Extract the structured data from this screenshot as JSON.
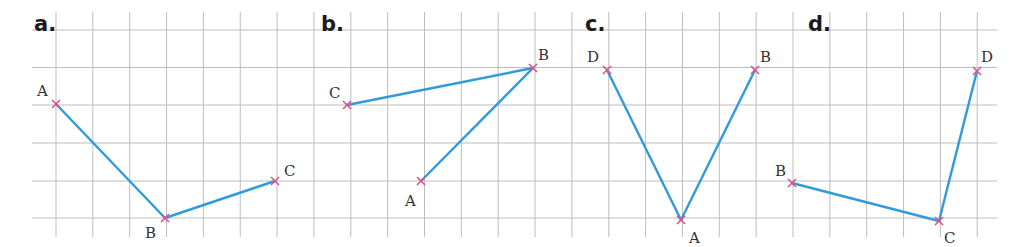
{
  "grid": {
    "x0": 56,
    "spacing_x": 36.85,
    "cols_from": 0,
    "cols_to": 25,
    "h_lines_y": [
      30,
      67.5,
      105,
      143,
      181,
      218
    ],
    "h_left": 32,
    "h_right": 997,
    "v_top": 12,
    "v_bottom": 237,
    "color": "#bdbdbd"
  },
  "colors": {
    "segment": "#2e9bdc",
    "marker": "#e0508a"
  },
  "panels": [
    {
      "label": "a.",
      "label_pos": [
        34,
        31
      ],
      "points": [
        {
          "name": "A",
          "x": 56,
          "y": 104,
          "lx": 37,
          "ly": 96
        },
        {
          "name": "B",
          "x": 165,
          "y": 218,
          "lx": 145,
          "ly": 238
        },
        {
          "name": "C",
          "x": 275,
          "y": 181,
          "lx": 284,
          "ly": 176
        }
      ],
      "segments": [
        [
          "A",
          "B"
        ],
        [
          "B",
          "C"
        ]
      ]
    },
    {
      "label": "b.",
      "label_pos": [
        321,
        31
      ],
      "points": [
        {
          "name": "C",
          "x": 347,
          "y": 105,
          "lx": 329,
          "ly": 98
        },
        {
          "name": "B",
          "x": 533,
          "y": 68,
          "lx": 538,
          "ly": 60
        },
        {
          "name": "A",
          "x": 421,
          "y": 181,
          "lx": 405,
          "ly": 206
        }
      ],
      "segments": [
        [
          "C",
          "B"
        ],
        [
          "B",
          "A"
        ]
      ]
    },
    {
      "label": "c.",
      "label_pos": [
        585,
        31
      ],
      "points": [
        {
          "name": "D",
          "x": 607,
          "y": 70,
          "lx": 587,
          "ly": 62
        },
        {
          "name": "A",
          "x": 681,
          "y": 220,
          "lx": 689,
          "ly": 243
        },
        {
          "name": "B",
          "x": 755,
          "y": 70,
          "lx": 760,
          "ly": 62
        }
      ],
      "segments": [
        [
          "D",
          "A"
        ],
        [
          "A",
          "B"
        ]
      ]
    },
    {
      "label": "d.",
      "label_pos": [
        808,
        31
      ],
      "points": [
        {
          "name": "B",
          "x": 792,
          "y": 183,
          "lx": 775,
          "ly": 176
        },
        {
          "name": "C",
          "x": 939,
          "y": 221,
          "lx": 944,
          "ly": 243
        },
        {
          "name": "D",
          "x": 977,
          "y": 71,
          "lx": 981,
          "ly": 62
        }
      ],
      "segments": [
        [
          "B",
          "C"
        ],
        [
          "C",
          "D"
        ]
      ]
    }
  ]
}
